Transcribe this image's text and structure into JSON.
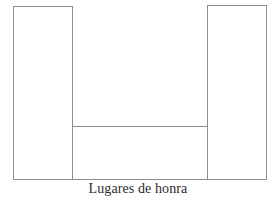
{
  "chart_data": {
    "type": "bar",
    "title": "",
    "subtitle": "",
    "xlabel": "Lugares de honra",
    "ylabel": "",
    "categories": [
      "",
      "",
      ""
    ],
    "values": [
      174,
      54,
      175
    ],
    "ylim": [
      0,
      191
    ],
    "grid": false,
    "legend": null,
    "legend_position": "none",
    "tick_labels": {
      "x": [],
      "y": []
    },
    "annotations": [],
    "style": {
      "bar_fill": "#ffffff",
      "bar_border": "#8d8d8d",
      "background": "#ffffff",
      "label_color": "#2b2b2b"
    },
    "bars": [
      {
        "name": "bar-left",
        "value": 174,
        "label": ""
      },
      {
        "name": "bar-middle",
        "value": 54,
        "label": ""
      },
      {
        "name": "bar-right",
        "value": 175,
        "label": ""
      }
    ]
  },
  "chart": {
    "axis_label": "Lugares de honra"
  }
}
